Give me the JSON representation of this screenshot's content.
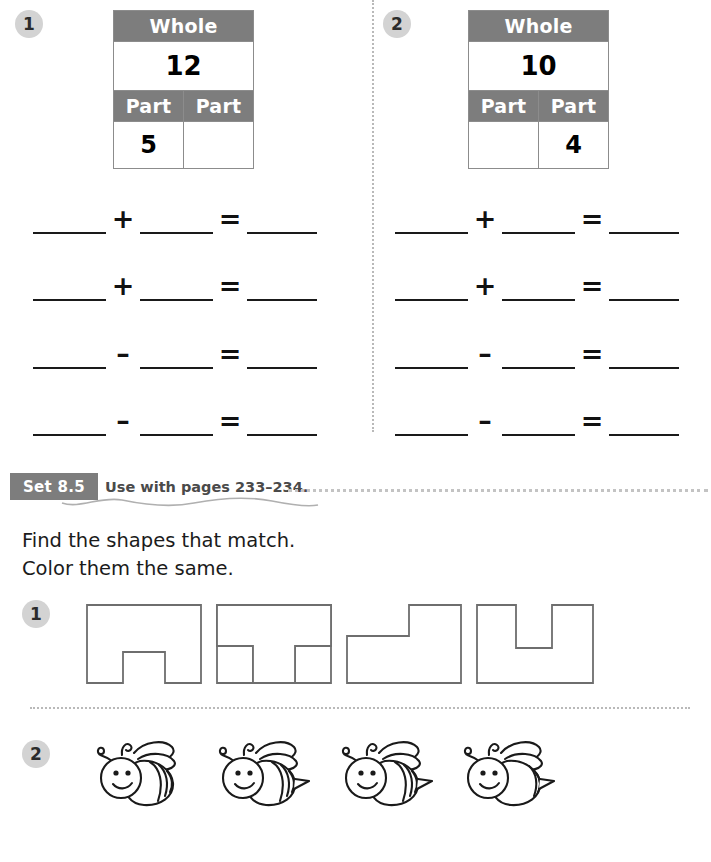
{
  "worksheet": {
    "top_section": {
      "problems": [
        {
          "number": "1",
          "table": {
            "whole_header": "Whole",
            "whole_value": "12",
            "part_header_left": "Part",
            "part_header_right": "Part",
            "part_value_left": "5",
            "part_value_right": ""
          },
          "equations": [
            {
              "operator": "+",
              "equals": "="
            },
            {
              "operator": "+",
              "equals": "="
            },
            {
              "operator": "–",
              "equals": "="
            },
            {
              "operator": "–",
              "equals": "="
            }
          ]
        },
        {
          "number": "2",
          "table": {
            "whole_header": "Whole",
            "whole_value": "10",
            "part_header_left": "Part",
            "part_header_right": "Part",
            "part_value_left": "",
            "part_value_right": "4"
          },
          "equations": [
            {
              "operator": "+",
              "equals": "="
            },
            {
              "operator": "+",
              "equals": "="
            },
            {
              "operator": "–",
              "equals": "="
            },
            {
              "operator": "–",
              "equals": "="
            }
          ]
        }
      ]
    },
    "set_section": {
      "set_label": "Set 8.5",
      "use_with": "Use with pages 233–234.",
      "instruction_line_1": "Find the shapes that match.",
      "instruction_line_2": "Color them the same.",
      "exercises": [
        {
          "number": "1",
          "type": "shapes",
          "shapes": [
            {
              "name": "inverted-u-shape"
            },
            {
              "name": "t-shape"
            },
            {
              "name": "l-shape"
            },
            {
              "name": "u-shape"
            }
          ]
        },
        {
          "number": "2",
          "type": "bees",
          "bees": [
            {
              "name": "bee-no-stinger",
              "stinger": false,
              "stripes": 4
            },
            {
              "name": "bee-with-stinger",
              "stinger": true,
              "stripes": 4
            },
            {
              "name": "bee-with-stinger",
              "stinger": true,
              "stripes": 4
            },
            {
              "name": "bee-few-stripes",
              "stinger": true,
              "stripes": 2
            }
          ]
        }
      ]
    },
    "colors": {
      "header_gray": "#7d7d7d",
      "badge_gray": "#d3d3d3",
      "dotted_gray": "#b9b9b9",
      "line_black": "#1a1a1a",
      "cell_border": "#8c8c8c"
    }
  }
}
